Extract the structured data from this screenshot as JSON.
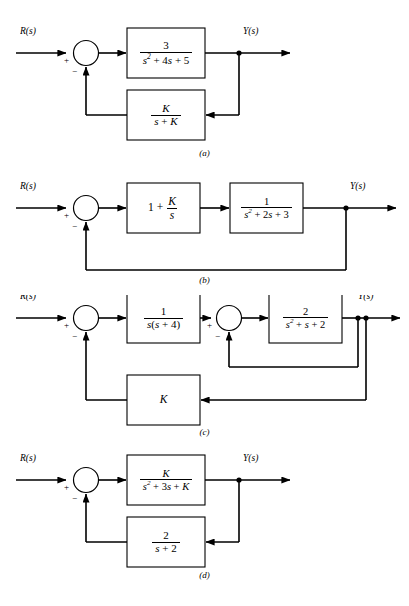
{
  "page": {
    "background": "#ffffff",
    "line_color": "#000000",
    "box_fill": "#ffffff",
    "width": 409,
    "height": 606
  },
  "figures": [
    {
      "id": "a",
      "caption": "(a)",
      "input_label": "R(s)",
      "output_label": "Y(s)",
      "summer": {
        "sign_left": "+",
        "sign_bottom": "−"
      },
      "forward_block": {
        "name": "forward-transfer-function",
        "numerator": "3",
        "denominator": "s² + 4s + 5",
        "num_text": "3",
        "den_parts": [
          {
            "t": "s",
            "style": "italic"
          },
          {
            "t": "2",
            "style": "sup"
          },
          {
            "t": " + 4",
            "style": "plain"
          },
          {
            "t": "s",
            "style": "italic"
          },
          {
            "t": " + 5",
            "style": "plain"
          }
        ]
      },
      "feedback_block": {
        "name": "feedback-transfer-function",
        "numerator": "K",
        "denominator": "s + K",
        "num_parts": [
          {
            "t": "K",
            "style": "italic"
          }
        ],
        "den_parts": [
          {
            "t": "s",
            "style": "italic"
          },
          {
            "t": " + ",
            "style": "plain"
          },
          {
            "t": "K",
            "style": "italic"
          }
        ]
      }
    },
    {
      "id": "b",
      "caption": "(b)",
      "input_label": "R(s)",
      "output_label": "Y(s)",
      "summer": {
        "sign_left": "+",
        "sign_bottom": "−"
      },
      "block1": {
        "name": "controller-block",
        "expression": "1 + K/s",
        "lead_text": "1 +",
        "numerator": "K",
        "denominator": "s"
      },
      "block2": {
        "name": "plant-block",
        "numerator": "1",
        "denominator": "s² + 2s + 3",
        "num_text": "1",
        "den_parts": [
          {
            "t": "s",
            "style": "italic"
          },
          {
            "t": "2",
            "style": "sup"
          },
          {
            "t": " + 2",
            "style": "plain"
          },
          {
            "t": "s",
            "style": "italic"
          },
          {
            "t": " + 3",
            "style": "plain"
          }
        ]
      },
      "feedback": {
        "type": "unity",
        "label": ""
      }
    },
    {
      "id": "c",
      "caption": "(c)",
      "input_label": "R(s)",
      "output_label": "Y(s)",
      "summer_outer": {
        "sign_left": "+",
        "sign_bottom": "−"
      },
      "summer_inner": {
        "sign_left": "+",
        "sign_bottom": "−"
      },
      "block1": {
        "name": "first-plant-block",
        "numerator": "1",
        "denominator": "s(s + 4)",
        "num_text": "1",
        "den_parts": [
          {
            "t": "s",
            "style": "italic"
          },
          {
            "t": "(",
            "style": "plain"
          },
          {
            "t": "s",
            "style": "italic"
          },
          {
            "t": " + 4)",
            "style": "plain"
          }
        ]
      },
      "block2": {
        "name": "second-plant-block",
        "numerator": "2",
        "denominator": "s² + s + 2",
        "num_text": "2",
        "den_parts": [
          {
            "t": "s",
            "style": "italic"
          },
          {
            "t": "2",
            "style": "sup"
          },
          {
            "t": " + ",
            "style": "plain"
          },
          {
            "t": "s",
            "style": "italic"
          },
          {
            "t": " + 2",
            "style": "plain"
          }
        ]
      },
      "gain_block": {
        "name": "gain-block",
        "label": "K"
      },
      "inner_feedback": {
        "type": "unity",
        "label": ""
      }
    },
    {
      "id": "d",
      "caption": "(d)",
      "input_label": "R(s)",
      "output_label": "Y(s)",
      "summer": {
        "sign_left": "+",
        "sign_bottom": "−"
      },
      "forward_block": {
        "name": "forward-transfer-function",
        "numerator": "K",
        "denominator": "s² + 3s + K",
        "num_parts": [
          {
            "t": "K",
            "style": "italic"
          }
        ],
        "den_parts": [
          {
            "t": "s",
            "style": "italic"
          },
          {
            "t": "2",
            "style": "sup"
          },
          {
            "t": " + 3",
            "style": "plain"
          },
          {
            "t": "s",
            "style": "italic"
          },
          {
            "t": " + ",
            "style": "plain"
          },
          {
            "t": "K",
            "style": "italic"
          }
        ]
      },
      "feedback_block": {
        "name": "feedback-transfer-function",
        "numerator": "2",
        "denominator": "s + 2",
        "num_text": "2",
        "den_parts": [
          {
            "t": "s",
            "style": "italic"
          },
          {
            "t": " + 2",
            "style": "plain"
          }
        ]
      }
    }
  ]
}
